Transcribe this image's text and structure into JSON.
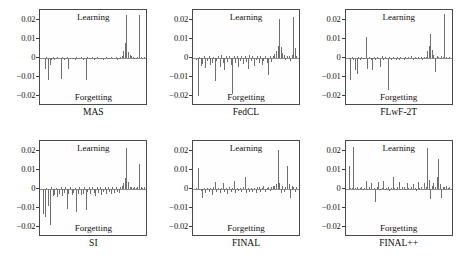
{
  "figure": {
    "inner_label_top": "Learning",
    "inner_label_bottom": "Forgetting",
    "y_ticks": [
      "0.02",
      "0.01",
      "0",
      "−0.01",
      "−0.02"
    ],
    "line_color": "#6f6f6f",
    "axis_color": "#4a4a4a",
    "background": "#ffffff"
  },
  "chart_data": {
    "type": "bar",
    "title": "",
    "xlabel": "",
    "ylabel": "",
    "ylim": [
      -0.025,
      0.025
    ],
    "yticks": [
      0.02,
      0.01,
      0,
      -0.01,
      -0.02
    ],
    "grid": false,
    "legend": "none",
    "annotations": [
      "Learning",
      "Forgetting"
    ],
    "layout": {
      "rows": 2,
      "cols": 3
    },
    "panels": [
      {
        "name": "MAS",
        "position": [
          0,
          0
        ],
        "values": [
          -0.0002,
          -0.0055,
          0.0004,
          -0.0115,
          -0.0035,
          -0.0008,
          0.0003,
          -0.0012,
          -0.0006,
          0.0005,
          -0.0004,
          -0.011,
          0.0006,
          -0.0009,
          -0.0003,
          0.0004,
          -0.0058,
          -0.0007,
          0.0002,
          -0.0005,
          -0.0011,
          0.0003,
          -0.0006,
          -0.0004,
          0.0005,
          -0.0013,
          -0.0003,
          -0.0112,
          0.0004,
          -0.0007,
          -0.0002,
          0.0006,
          -0.0009,
          -0.0004,
          0.0003,
          -0.0006,
          -0.0005,
          0.0002,
          -0.0008,
          -0.0003,
          0.0004,
          -0.0007,
          -0.0002,
          0.0005,
          -0.0004,
          -0.0006,
          0.0003,
          -0.001,
          -0.0003,
          0.0004,
          0.0012,
          0.0034,
          0.0078,
          0.0225,
          0.003,
          0.0014,
          0.0008,
          0.0003,
          -0.0004,
          0.0002,
          0.0006,
          0.0226,
          0.0003,
          -0.0002,
          0.0004
        ]
      },
      {
        "name": "FedCL",
        "position": [
          0,
          1
        ],
        "values": [
          -0.0008,
          -0.0198,
          0.0006,
          -0.0042,
          -0.003,
          0.0009,
          -0.005,
          -0.0018,
          0.0012,
          -0.0035,
          -0.0024,
          0.0007,
          -0.0118,
          -0.0016,
          0.001,
          -0.0045,
          0.0014,
          -0.0028,
          -0.006,
          0.0011,
          -0.002,
          0.0008,
          -0.0038,
          -0.019,
          0.0013,
          -0.0026,
          0.0009,
          -0.0048,
          -0.0015,
          0.0012,
          -0.0032,
          0.001,
          -0.0022,
          -0.0055,
          0.0014,
          -0.0018,
          0.0008,
          -0.004,
          -0.0012,
          0.0011,
          -0.0028,
          0.0009,
          -0.0035,
          -0.0016,
          0.0013,
          -0.0024,
          -0.009,
          0.001,
          -0.002,
          0.0012,
          0.002,
          0.0038,
          0.0062,
          0.0205,
          0.0055,
          0.0026,
          0.0014,
          -0.001,
          0.0008,
          0.0012,
          -0.0018,
          0.0016,
          0.0212,
          0.005,
          0.001
        ]
      },
      {
        "name": "FLwF-2T",
        "position": [
          0,
          2
        ],
        "values": [
          -0.0004,
          -0.0115,
          0.0005,
          -0.0008,
          -0.006,
          -0.0085,
          0.0006,
          -0.0012,
          0.0004,
          -0.0007,
          -0.0005,
          0.0108,
          -0.0055,
          0.0007,
          -0.001,
          -0.0062,
          0.0005,
          -0.0009,
          0.0004,
          -0.0006,
          -0.0048,
          0.0008,
          -0.0011,
          0.0005,
          -0.0007,
          -0.0165,
          0.0006,
          -0.0009,
          0.0004,
          -0.0005,
          -0.0012,
          0.0007,
          -0.0008,
          0.0005,
          -0.0006,
          -0.001,
          0.0004,
          -0.0007,
          0.0006,
          -0.0005,
          0.0008,
          -0.0009,
          0.0005,
          -0.0004,
          0.0007,
          -0.0006,
          0.0005,
          -0.0008,
          0.0004,
          0.0006,
          0.0035,
          0.006,
          0.0125,
          0.0042,
          0.0018,
          -0.0075,
          0.0012,
          0.0006,
          -0.0004,
          0.0008,
          0.0005,
          0.0228,
          0.0006,
          -0.0003,
          0.0005
        ]
      },
      {
        "name": "SI",
        "position": [
          1,
          0
        ],
        "values": [
          -0.013,
          -0.0145,
          0.0006,
          -0.009,
          -0.0188,
          0.0008,
          -0.0038,
          -0.003,
          0.0007,
          -0.0042,
          -0.0025,
          0.0009,
          -0.0035,
          -0.002,
          0.0008,
          -0.0105,
          -0.0028,
          0.001,
          -0.0032,
          -0.0022,
          0.0007,
          -0.0118,
          -0.0026,
          0.0009,
          -0.003,
          -0.0024,
          0.0008,
          -0.011,
          -0.0018,
          0.001,
          -0.0028,
          0.0009,
          -0.002,
          -0.0035,
          0.0008,
          -0.0022,
          0.001,
          -0.003,
          -0.0016,
          0.0009,
          -0.0024,
          0.0008,
          -0.0018,
          -0.0026,
          0.001,
          -0.002,
          0.0009,
          -0.0015,
          -0.0022,
          0.0011,
          0.0016,
          0.003,
          0.0058,
          0.0215,
          0.0034,
          0.0012,
          0.0008,
          0.0006,
          0.001,
          0.0007,
          0.0009,
          0.0128,
          0.0008,
          0.0006,
          0.001
        ]
      },
      {
        "name": "FINAL",
        "position": [
          1,
          1
        ],
        "values": [
          0.0004,
          0.0108,
          -0.0006,
          -0.0012,
          -0.0048,
          0.0005,
          -0.002,
          0.0007,
          -0.0015,
          0.0006,
          -0.003,
          0.0008,
          0.0035,
          -0.0018,
          0.0005,
          -0.0022,
          0.0007,
          0.003,
          -0.0014,
          0.0006,
          -0.0025,
          0.0009,
          -0.0016,
          0.0005,
          0.0042,
          -0.002,
          0.0007,
          -0.0012,
          0.0006,
          -0.0018,
          0.0008,
          0.006,
          -0.0022,
          0.0005,
          -0.0014,
          0.0007,
          -0.0016,
          0.0006,
          -0.002,
          0.0008,
          0.0012,
          -0.0015,
          0.0007,
          0.0014,
          -0.0018,
          0.0006,
          0.001,
          -0.0012,
          0.0008,
          0.0016,
          0.0018,
          0.0024,
          0.0205,
          0.003,
          -0.0022,
          0.0014,
          -0.0016,
          0.001,
          0.012,
          0.0026,
          -0.0048,
          0.0018,
          0.0012,
          -0.0014,
          0.0008
        ]
      },
      {
        "name": "FINAL++",
        "position": [
          1,
          2
        ],
        "values": [
          0.0122,
          0.0006,
          0.0004,
          0.0218,
          0.0005,
          0.0008,
          -0.0006,
          0.0004,
          0.001,
          -0.0005,
          0.0006,
          0.004,
          -0.0004,
          0.0008,
          0.003,
          -0.0006,
          0.0005,
          -0.007,
          0.0009,
          0.0038,
          -0.0005,
          0.0007,
          0.0042,
          -0.0004,
          0.0006,
          0.001,
          -0.0008,
          0.0005,
          0.0062,
          0.0007,
          -0.0005,
          0.0009,
          0.0034,
          -0.0006,
          0.0008,
          0.0012,
          -0.0004,
          0.003,
          0.0007,
          -0.0005,
          0.0009,
          0.0026,
          0.0006,
          -0.0008,
          0.0038,
          0.0007,
          0.001,
          -0.0005,
          0.0032,
          0.0008,
          0.0215,
          0.0046,
          -0.005,
          0.0018,
          0.003,
          0.001,
          0.006,
          0.0158,
          0.0024,
          -0.0046,
          0.0012,
          0.0008,
          0.0016,
          0.0006,
          0.001
        ]
      }
    ]
  }
}
